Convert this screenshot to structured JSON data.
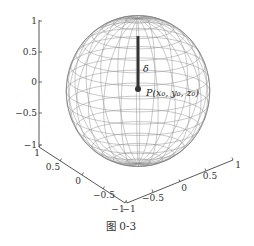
{
  "chart_data": {
    "type": "surface3d",
    "title": "",
    "axes": {
      "z": {
        "ticks": [
          "1",
          "0.5",
          "0",
          "−0.5",
          "−1"
        ],
        "range": [
          -1,
          1
        ]
      },
      "x": {
        "ticks": [
          "1",
          "0.5",
          "0",
          "−0.5",
          "−1"
        ],
        "range": [
          -1,
          1
        ]
      },
      "y": {
        "ticks": [
          "−1",
          "−0.5",
          "0",
          "0.5",
          "1"
        ],
        "range": [
          -1,
          1
        ]
      }
    },
    "sphere": {
      "center": [
        0,
        0,
        0
      ],
      "radius": 1,
      "style": "wireframe"
    },
    "rod": {
      "from": [
        0,
        0,
        1
      ],
      "to": [
        0,
        0,
        0
      ],
      "label": "δ"
    },
    "point": {
      "label": "P(x₀, y₀, z₀)",
      "position": [
        0,
        0,
        0
      ]
    },
    "grid": false,
    "legend": null
  },
  "labels": {
    "delta": "δ",
    "point": "P(x₀, y₀, z₀)",
    "caption": "图 0-3"
  },
  "colors": {
    "wire": "#8a8a8a",
    "axis": "#333333",
    "rod": "#333333"
  }
}
